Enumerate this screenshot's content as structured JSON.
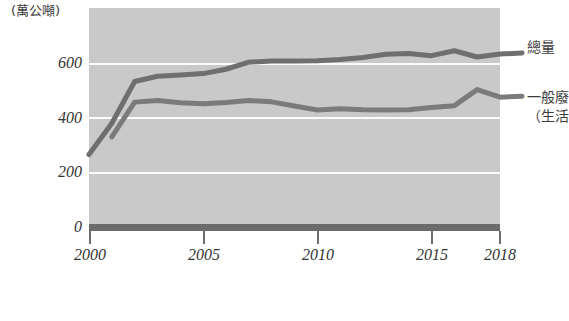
{
  "unit_caption": "(萬公噸)",
  "axis": {
    "y_ticks": [
      "0",
      "200",
      "400",
      "600"
    ],
    "x_ticks": [
      "2000",
      "2005",
      "2010",
      "2015",
      "2018"
    ]
  },
  "series_labels": {
    "total": "總量",
    "msw_line1": "一般廢",
    "msw_line2": "（生活"
  },
  "colors": {
    "plot_background": "#c9c9c9",
    "gridline": "#fbfbfb",
    "axis": "#6b6b6b",
    "line_total": "#6f6f6f",
    "line_msw": "#7b7b7b",
    "text": "#333333"
  },
  "chart_data": {
    "type": "line",
    "title": "",
    "xlabel": "",
    "ylabel": "",
    "unit": "萬公噸",
    "grid": true,
    "legend_position": "right-inline",
    "xlim": [
      2000,
      2018
    ],
    "ylim": [
      0,
      700
    ],
    "x": [
      2000,
      2001,
      2002,
      2003,
      2004,
      2005,
      2006,
      2007,
      2008,
      2009,
      2010,
      2011,
      2012,
      2013,
      2014,
      2015,
      2016,
      2017,
      2018
    ],
    "series": [
      {
        "name": "總量",
        "values": [
          263,
          378,
          532,
          551,
          556,
          561,
          577,
          603,
          607,
          607,
          608,
          613,
          620,
          632,
          635,
          627,
          645,
          622,
          633
        ]
      },
      {
        "name": "一般廢棄物（生活垃圾）",
        "values": [
          null,
          328,
          456,
          462,
          454,
          450,
          455,
          462,
          457,
          442,
          427,
          432,
          428,
          427,
          428,
          436,
          443,
          502,
          474
        ]
      }
    ]
  }
}
